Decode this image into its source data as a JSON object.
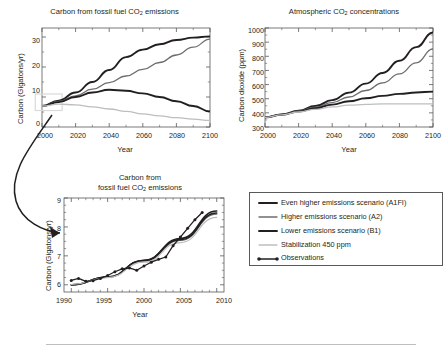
{
  "figure": {
    "panels": [
      "emissions-main",
      "concentrations",
      "emissions-inset"
    ],
    "legend_title": "",
    "separator": true
  },
  "legend": {
    "entries": [
      {
        "label": "Even higher emissions scenario (A1FI)",
        "color": "#231f20",
        "width": 1.9,
        "marker": false
      },
      {
        "label": "Higher emissions scenario (A2)",
        "color": "#6d6e71",
        "width": 1.3,
        "marker": false
      },
      {
        "label": "Lower emissions scenario (B1)",
        "color": "#231f20",
        "width": 1.9,
        "marker": false
      },
      {
        "label": "Stabilization 450 ppm",
        "color": "#bcbec0",
        "width": 1.3,
        "marker": false
      },
      {
        "label": "Observations",
        "color": "#231f20",
        "width": 1.3,
        "marker": true
      }
    ]
  },
  "chart_data": [
    {
      "id": "emissions-main",
      "type": "line",
      "title": "Carbon from fossil fuel CO2 emissions",
      "title_parts": [
        "Carbon from fossil fuel CO",
        "2",
        " emissions"
      ],
      "xlabel": "Year",
      "ylabel": "Carbon (Gigatons/yr)",
      "xlim": [
        2000,
        2100
      ],
      "ylim": [
        0,
        33
      ],
      "xticks": [
        2000,
        2020,
        2040,
        2060,
        2080,
        2100
      ],
      "yticks": [
        0,
        10,
        20,
        30
      ],
      "grid": false,
      "highlight_box": {
        "x0": 1996,
        "x1": 2012,
        "y0": 5.5,
        "y1": 11.0,
        "color": "#d9d9d9"
      },
      "series": [
        {
          "name": "Even higher emissions scenario (A1FI)",
          "color": "#231f20",
          "width": 1.9,
          "x": [
            2000,
            2010,
            2020,
            2030,
            2040,
            2050,
            2060,
            2070,
            2080,
            2090,
            2100
          ],
          "y": [
            7.0,
            8.8,
            11.5,
            15.0,
            19.0,
            23.3,
            25.8,
            27.6,
            29.0,
            29.8,
            30.2
          ]
        },
        {
          "name": "Higher emissions scenario (A2)",
          "color": "#6d6e71",
          "width": 1.3,
          "x": [
            2000,
            2010,
            2020,
            2030,
            2040,
            2050,
            2060,
            2070,
            2080,
            2090,
            2100
          ],
          "y": [
            7.0,
            8.5,
            10.4,
            12.6,
            14.8,
            17.0,
            19.2,
            21.5,
            24.0,
            26.6,
            29.3
          ]
        },
        {
          "name": "Lower emissions scenario (B1)",
          "color": "#231f20",
          "width": 1.9,
          "x": [
            2000,
            2010,
            2020,
            2030,
            2040,
            2050,
            2060,
            2070,
            2080,
            2090,
            2100
          ],
          "y": [
            7.0,
            8.3,
            10.0,
            11.5,
            12.4,
            12.1,
            11.2,
            10.0,
            8.6,
            7.0,
            5.2
          ]
        },
        {
          "name": "Stabilization 450 ppm",
          "color": "#bcbec0",
          "width": 1.3,
          "x": [
            2000,
            2010,
            2020,
            2030,
            2040,
            2050,
            2060,
            2070,
            2080,
            2090,
            2100
          ],
          "y": [
            7.0,
            7.6,
            7.4,
            6.7,
            6.0,
            5.2,
            4.4,
            3.7,
            3.1,
            2.6,
            2.2
          ]
        }
      ]
    },
    {
      "id": "concentrations",
      "type": "line",
      "title": "Atmospheric CO2 concentrations",
      "title_parts": [
        "Atmospheric CO",
        "2",
        " concentrations"
      ],
      "xlabel": "Year",
      "ylabel": "Carbon dioxide (ppm)",
      "xlim": [
        2000,
        2100
      ],
      "ylim": [
        300,
        1000
      ],
      "xticks": [
        2000,
        2020,
        2040,
        2060,
        2080,
        2100
      ],
      "yticks": [
        300,
        400,
        500,
        600,
        700,
        800,
        900,
        1000
      ],
      "grid": false,
      "series": [
        {
          "name": "Even higher emissions scenario (A1FI)",
          "color": "#231f20",
          "width": 1.9,
          "x": [
            2000,
            2010,
            2020,
            2030,
            2040,
            2050,
            2060,
            2070,
            2080,
            2090,
            2100
          ],
          "y": [
            368,
            389,
            415,
            448,
            490,
            543,
            607,
            682,
            768,
            865,
            968
          ]
        },
        {
          "name": "Higher emissions scenario (A2)",
          "color": "#6d6e71",
          "width": 1.3,
          "x": [
            2000,
            2010,
            2020,
            2030,
            2040,
            2050,
            2060,
            2070,
            2080,
            2090,
            2100
          ],
          "y": [
            368,
            388,
            412,
            440,
            473,
            512,
            558,
            612,
            676,
            754,
            852
          ]
        },
        {
          "name": "Lower emissions scenario (B1)",
          "color": "#231f20",
          "width": 1.9,
          "x": [
            2000,
            2010,
            2020,
            2030,
            2040,
            2050,
            2060,
            2070,
            2080,
            2090,
            2100
          ],
          "y": [
            368,
            387,
            409,
            433,
            458,
            482,
            503,
            520,
            534,
            544,
            550
          ]
        },
        {
          "name": "Stabilization 450 ppm",
          "color": "#bcbec0",
          "width": 1.3,
          "x": [
            2000,
            2010,
            2020,
            2030,
            2040,
            2050,
            2060,
            2070,
            2080,
            2090,
            2100
          ],
          "y": [
            368,
            386,
            406,
            425,
            442,
            454,
            460,
            463,
            464,
            464,
            464
          ]
        }
      ]
    },
    {
      "id": "emissions-inset",
      "type": "line",
      "title": "Carbon from fossil fuel CO2 emissions",
      "title_parts": [
        "Carbon from",
        "fossil fuel CO",
        "2",
        " emissions"
      ],
      "xlabel": "Year",
      "ylabel": "Carbon (Gigatons/yr)",
      "xlim": [
        1989,
        2011
      ],
      "ylim": [
        5.75,
        9.0
      ],
      "xticks": [
        1990,
        1995,
        2000,
        2005,
        2010
      ],
      "yticks": [
        6,
        7,
        8,
        9
      ],
      "grid": false,
      "series": [
        {
          "name": "Even higher emissions scenario (A1FI)",
          "color": "#231f20",
          "width": 1.6,
          "x": [
            1990,
            1995,
            2000,
            2005,
            2010
          ],
          "y": [
            5.99,
            6.27,
            6.85,
            7.6,
            8.55
          ]
        },
        {
          "name": "Higher emissions scenario (A2)",
          "color": "#6d6e71",
          "width": 1.2,
          "x": [
            1990,
            1995,
            2000,
            2005,
            2010
          ],
          "y": [
            6.0,
            6.26,
            6.82,
            7.53,
            8.44
          ]
        },
        {
          "name": "Lower emissions scenario (B1)",
          "color": "#231f20",
          "width": 1.6,
          "x": [
            1990,
            1995,
            2000,
            2005,
            2010
          ],
          "y": [
            6.0,
            6.27,
            6.84,
            7.56,
            8.48
          ]
        },
        {
          "name": "Stabilization 450 ppm",
          "color": "#bcbec0",
          "width": 1.2,
          "x": [
            1990,
            1995,
            2000,
            2005,
            2010
          ],
          "y": [
            6.01,
            6.25,
            6.78,
            7.46,
            8.33
          ]
        },
        {
          "name": "Observations",
          "color": "#231f20",
          "width": 1.3,
          "marker": true,
          "x": [
            1990,
            1991,
            1992,
            1993,
            1994,
            1995,
            1996,
            1997,
            1998,
            1999,
            2000,
            2001,
            2002,
            2003,
            2004,
            2005,
            2006,
            2007,
            2008
          ],
          "y": [
            6.15,
            6.22,
            6.12,
            6.14,
            6.22,
            6.32,
            6.45,
            6.55,
            6.58,
            6.5,
            6.65,
            6.78,
            6.88,
            6.96,
            7.35,
            7.65,
            7.95,
            8.25,
            8.5
          ]
        }
      ]
    }
  ]
}
